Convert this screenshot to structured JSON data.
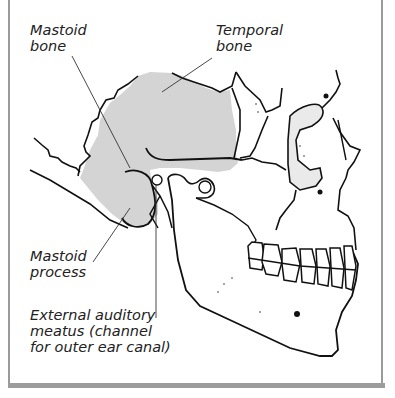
{
  "diagram": {
    "labels": {
      "mastoid_bone": "Mastoid\nbone",
      "temporal_bone": "Temporal\nbone",
      "mastoid_process": "Mastoid\nprocess",
      "external_auditory_meatus": "External auditory\nmeatus (channel\nfor outer ear canal)"
    },
    "colors": {
      "highlight_fill": "#d4d4d4",
      "outline": "#111111",
      "frame": "#9a9a9a",
      "label_text": "#222222"
    }
  }
}
